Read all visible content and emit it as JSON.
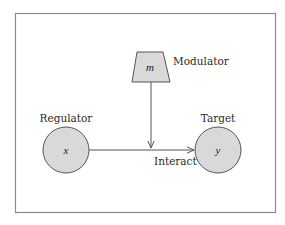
{
  "diagram": {
    "colors": {
      "frame": "#8a8a8a",
      "node_fill": "#d9d9d9",
      "node_stroke": "#555555",
      "edge": "#555555",
      "text": "#2a2a2a"
    },
    "nodes": {
      "modulator": {
        "label": "Modulator",
        "symbol": "m",
        "shape": "trapezoid"
      },
      "regulator": {
        "label": "Regulator",
        "symbol": "x",
        "shape": "circle"
      },
      "target": {
        "label": "Target",
        "symbol": "y",
        "shape": "circle"
      }
    },
    "edges": [
      {
        "from": "regulator",
        "to": "target",
        "label": "Interact"
      },
      {
        "from": "modulator",
        "to": "regulator-target-edge",
        "label": ""
      }
    ]
  }
}
